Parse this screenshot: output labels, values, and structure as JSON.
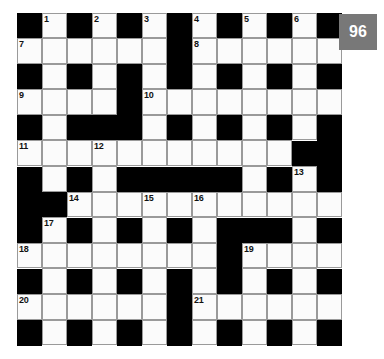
{
  "page_badge": {
    "label": "96",
    "background_color": "#787878",
    "text_color": "#ffffff"
  },
  "crossword": {
    "rows": 13,
    "cols": 13,
    "colors": {
      "block": "#000000",
      "cell": "#fbfbfb",
      "grid_line": "#9a9a9a",
      "number_text": "#111111"
    },
    "grid": [
      [
        "#",
        "W",
        "#",
        "W",
        "#",
        "W",
        "#",
        "W",
        "#",
        "W",
        "#",
        "W",
        "#"
      ],
      [
        "W",
        "W",
        "W",
        "W",
        "W",
        "W",
        "#",
        "W",
        "W",
        "W",
        "W",
        "W",
        "W"
      ],
      [
        "#",
        "W",
        "#",
        "W",
        "#",
        "W",
        "#",
        "W",
        "#",
        "W",
        "#",
        "W",
        "#"
      ],
      [
        "W",
        "W",
        "W",
        "W",
        "#",
        "W",
        "W",
        "W",
        "W",
        "W",
        "W",
        "W",
        "W"
      ],
      [
        "#",
        "W",
        "#",
        "#",
        "#",
        "W",
        "#",
        "W",
        "#",
        "W",
        "#",
        "W",
        "#"
      ],
      [
        "W",
        "W",
        "W",
        "W",
        "W",
        "W",
        "W",
        "W",
        "W",
        "W",
        "W",
        "#",
        "#"
      ],
      [
        "#",
        "W",
        "#",
        "W",
        "#",
        "#",
        "#",
        "#",
        "#",
        "W",
        "#",
        "W",
        "#"
      ],
      [
        "#",
        "#",
        "W",
        "W",
        "W",
        "W",
        "W",
        "W",
        "W",
        "W",
        "W",
        "W",
        "W"
      ],
      [
        "#",
        "W",
        "#",
        "W",
        "#",
        "W",
        "#",
        "W",
        "#",
        "#",
        "#",
        "W",
        "#"
      ],
      [
        "W",
        "W",
        "W",
        "W",
        "W",
        "W",
        "W",
        "W",
        "#",
        "W",
        "W",
        "W",
        "W"
      ],
      [
        "#",
        "W",
        "#",
        "W",
        "#",
        "W",
        "#",
        "W",
        "#",
        "W",
        "#",
        "W",
        "#"
      ],
      [
        "W",
        "W",
        "W",
        "W",
        "W",
        "W",
        "#",
        "W",
        "W",
        "W",
        "W",
        "W",
        "W"
      ],
      [
        "#",
        "W",
        "#",
        "W",
        "#",
        "W",
        "#",
        "W",
        "#",
        "W",
        "#",
        "W",
        "#"
      ]
    ],
    "numbers": [
      {
        "row": 0,
        "col": 1,
        "label": "1"
      },
      {
        "row": 0,
        "col": 3,
        "label": "2"
      },
      {
        "row": 0,
        "col": 5,
        "label": "3"
      },
      {
        "row": 0,
        "col": 7,
        "label": "4"
      },
      {
        "row": 0,
        "col": 9,
        "label": "5"
      },
      {
        "row": 0,
        "col": 11,
        "label": "6"
      },
      {
        "row": 1,
        "col": 0,
        "label": "7"
      },
      {
        "row": 1,
        "col": 7,
        "label": "8"
      },
      {
        "row": 3,
        "col": 0,
        "label": "9"
      },
      {
        "row": 3,
        "col": 5,
        "label": "10"
      },
      {
        "row": 5,
        "col": 0,
        "label": "11"
      },
      {
        "row": 5,
        "col": 3,
        "label": "12"
      },
      {
        "row": 6,
        "col": 11,
        "label": "13"
      },
      {
        "row": 7,
        "col": 2,
        "label": "14"
      },
      {
        "row": 7,
        "col": 5,
        "label": "15"
      },
      {
        "row": 7,
        "col": 7,
        "label": "16"
      },
      {
        "row": 8,
        "col": 1,
        "label": "17"
      },
      {
        "row": 9,
        "col": 0,
        "label": "18"
      },
      {
        "row": 9,
        "col": 9,
        "label": "19"
      },
      {
        "row": 11,
        "col": 0,
        "label": "20"
      },
      {
        "row": 11,
        "col": 7,
        "label": "21"
      }
    ]
  }
}
